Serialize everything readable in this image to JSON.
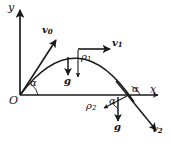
{
  "figure": {
    "type": "physics-diagram",
    "width": 171,
    "height": 150,
    "background_color": "#ffffff",
    "stroke_color": "#1a1a1a"
  },
  "axes": {
    "y_label": "y",
    "x_label": "x",
    "origin_label": "O",
    "y_axis": {
      "x": 20,
      "y_top": 8,
      "y_bottom": 95
    },
    "x_axis": {
      "y": 95,
      "x_left": 20,
      "x_right": 160
    }
  },
  "trajectory": {
    "kind": "parabola",
    "launch_point": {
      "x": 20,
      "y": 95
    },
    "apex": {
      "x": 78,
      "y": 49
    },
    "landing_point": {
      "x": 128,
      "y": 95
    },
    "end_point": {
      "x": 155,
      "y": 128
    }
  },
  "vectors": [
    {
      "name": "v0",
      "label": "v",
      "subscript": "0",
      "description": "initial velocity at launch, tangent to trajectory",
      "from": {
        "x": 20,
        "y": 95
      },
      "to": {
        "x": 55,
        "y": 40
      },
      "label_pos": {
        "x": 44,
        "y": 30
      }
    },
    {
      "name": "v1",
      "label": "v",
      "subscript": "1",
      "description": "velocity at apex, horizontal",
      "from": {
        "x": 78,
        "y": 49
      },
      "to": {
        "x": 110,
        "y": 49
      },
      "label_pos": {
        "x": 112,
        "y": 43
      }
    },
    {
      "name": "v2",
      "label": "v",
      "subscript": "2",
      "description": "velocity after landing point, along trajectory",
      "from": {
        "x": 128,
        "y": 95
      },
      "to": {
        "x": 155,
        "y": 128
      },
      "label_pos": {
        "x": 154,
        "y": 126
      }
    },
    {
      "name": "rho1",
      "label": "ρ",
      "subscript": "1",
      "description": "radius of curvature at apex, pointing down",
      "from": {
        "x": 78,
        "y": 51
      },
      "to": {
        "x": 78,
        "y": 78
      },
      "label_pos": {
        "x": 81,
        "y": 55
      }
    },
    {
      "name": "rho2",
      "label": "ρ",
      "subscript": "2",
      "description": "radius of curvature at landing point, pointing down-left",
      "from": {
        "x": 127,
        "y": 96
      },
      "to": {
        "x": 105,
        "y": 108
      },
      "label_pos": {
        "x": 88,
        "y": 105
      }
    },
    {
      "name": "g-apex",
      "label": "g",
      "subscript": "",
      "description": "gravity vector below apex",
      "from": {
        "x": 68,
        "y": 57
      },
      "to": {
        "x": 68,
        "y": 76
      },
      "label_pos": {
        "x": 64,
        "y": 78
      }
    },
    {
      "name": "g-landing",
      "label": "g",
      "subscript": "",
      "description": "gravity vector below landing point",
      "from": {
        "x": 118,
        "y": 98
      },
      "to": {
        "x": 118,
        "y": 122
      },
      "label_pos": {
        "x": 114,
        "y": 124
      }
    }
  ],
  "angles": [
    {
      "name": "alpha-launch",
      "label": "α",
      "description": "launch angle between x-axis and v0",
      "label_pos": {
        "x": 31,
        "y": 82
      }
    },
    {
      "name": "alpha-landing-left",
      "label": "α",
      "description": "angle between rho2 and downward vertical at landing",
      "label_pos": {
        "x": 112,
        "y": 99
      }
    },
    {
      "name": "alpha-landing-right",
      "label": "α",
      "description": "angle between x-axis and descending trajectory",
      "label_pos": {
        "x": 133,
        "y": 89
      }
    }
  ]
}
